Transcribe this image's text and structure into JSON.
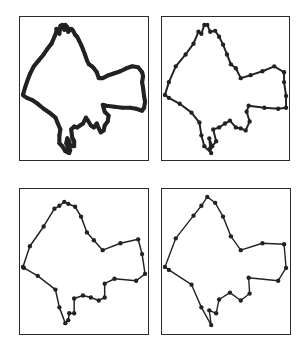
{
  "figure": {
    "line_color": "#222222",
    "panels": [
      {
        "id": "p1",
        "level": "original dense contour",
        "stroke_width": 4.2,
        "vertex_radius": 1.9,
        "step": 1
      },
      {
        "id": "p2",
        "level": "lightly simplified",
        "stroke_width": 2.0,
        "vertex_radius": 2.2,
        "step": 2
      },
      {
        "id": "p3",
        "level": "moderately simplified",
        "stroke_width": 1.5,
        "vertex_radius": 2.2,
        "step": 3
      },
      {
        "id": "p4",
        "level": "heavily simplified",
        "stroke_width": 1.4,
        "vertex_radius": 2.2,
        "step": 4
      }
    ],
    "contour": [
      [
        3,
        79
      ],
      [
        5,
        72
      ],
      [
        7,
        66
      ],
      [
        10,
        58
      ],
      [
        14,
        50
      ],
      [
        19,
        44
      ],
      [
        24,
        38
      ],
      [
        28,
        32
      ],
      [
        32,
        27
      ],
      [
        35,
        20
      ],
      [
        37,
        15
      ],
      [
        37,
        12
      ],
      [
        40,
        17
      ],
      [
        41,
        9
      ],
      [
        43,
        8
      ],
      [
        45,
        13
      ],
      [
        46,
        8
      ],
      [
        48,
        10
      ],
      [
        49,
        15
      ],
      [
        52,
        12
      ],
      [
        54,
        14
      ],
      [
        56,
        18
      ],
      [
        58,
        20
      ],
      [
        60,
        24
      ],
      [
        62,
        28
      ],
      [
        64,
        33
      ],
      [
        66,
        38
      ],
      [
        68,
        44
      ],
      [
        70,
        48
      ],
      [
        73,
        50
      ],
      [
        75,
        52
      ],
      [
        78,
        56
      ],
      [
        80,
        62
      ],
      [
        84,
        62
      ],
      [
        90,
        59
      ],
      [
        96,
        57
      ],
      [
        102,
        55
      ],
      [
        108,
        52
      ],
      [
        114,
        50
      ],
      [
        120,
        51
      ],
      [
        124,
        56
      ],
      [
        125,
        60
      ],
      [
        124,
        66
      ],
      [
        125,
        72
      ],
      [
        126,
        80
      ],
      [
        127,
        86
      ],
      [
        126,
        92
      ],
      [
        124,
        95
      ],
      [
        118,
        93
      ],
      [
        112,
        92
      ],
      [
        104,
        92
      ],
      [
        96,
        91
      ],
      [
        88,
        90
      ],
      [
        84,
        89
      ],
      [
        86,
        96
      ],
      [
        90,
        100
      ],
      [
        89,
        106
      ],
      [
        86,
        110
      ],
      [
        85,
        115
      ],
      [
        82,
        117
      ],
      [
        80,
        113
      ],
      [
        78,
        108
      ],
      [
        75,
        112
      ],
      [
        72,
        110
      ],
      [
        69,
        105
      ],
      [
        67,
        102
      ],
      [
        64,
        108
      ],
      [
        61,
        110
      ],
      [
        58,
        112
      ],
      [
        55,
        111
      ],
      [
        52,
        114
      ],
      [
        53,
        122
      ],
      [
        55,
        126
      ],
      [
        55,
        131
      ],
      [
        51,
        131
      ],
      [
        50,
        126
      ],
      [
        48,
        123
      ],
      [
        47,
        128
      ],
      [
        49,
        133
      ],
      [
        51,
        135
      ],
      [
        50,
        138
      ],
      [
        46,
        136
      ],
      [
        43,
        131
      ],
      [
        40,
        128
      ],
      [
        40,
        120
      ],
      [
        41,
        114
      ],
      [
        38,
        107
      ],
      [
        36,
        102
      ],
      [
        30,
        97
      ],
      [
        24,
        93
      ],
      [
        18,
        88
      ],
      [
        12,
        84
      ],
      [
        7,
        82
      ],
      [
        4,
        80
      ]
    ]
  }
}
